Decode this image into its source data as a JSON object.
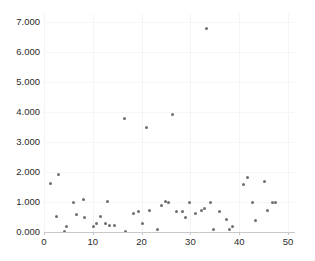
{
  "chart_data": {
    "type": "scatter",
    "title": "",
    "xlabel": "",
    "ylabel": "",
    "xlim": [
      0,
      51.5
    ],
    "ylim": [
      0,
      7000
    ],
    "xticks": [
      "0",
      "10",
      "20",
      "30",
      "40",
      "50"
    ],
    "xtick_values": [
      0,
      10,
      20,
      30,
      40,
      50
    ],
    "yticks": [
      "0.000",
      "1.000",
      "2.000",
      "3.000",
      "4.000",
      "5.000",
      "6.000",
      "7.000"
    ],
    "ytick_values": [
      0,
      1000,
      2000,
      3000,
      4000,
      5000,
      6000,
      7000
    ],
    "grid": true,
    "legend": null,
    "marker_color": "#6e6e6e",
    "axis_color": "#c9c9c9",
    "grid_color": "#f4f4f4",
    "background_color": "#ffffff",
    "series": [
      {
        "name": "series-1",
        "points": [
          [
            1.4,
            1633
          ],
          [
            2.9,
            1933
          ],
          [
            2.5,
            533
          ],
          [
            4.1,
            33
          ],
          [
            4.7,
            200
          ],
          [
            6.1,
            1000
          ],
          [
            6.6,
            567
          ],
          [
            8.0,
            1067
          ],
          [
            8.2,
            467
          ],
          [
            10.2,
            167
          ],
          [
            10.8,
            267
          ],
          [
            11.6,
            533
          ],
          [
            12.5,
            300
          ],
          [
            13.5,
            233
          ],
          [
            14.5,
            233
          ],
          [
            16.4,
            3767
          ],
          [
            16.8,
            33
          ],
          [
            18.3,
            633
          ],
          [
            19.3,
            700
          ],
          [
            20.1,
            267
          ],
          [
            21.1,
            3467
          ],
          [
            21.6,
            733
          ],
          [
            23.2,
            100
          ],
          [
            24.0,
            900
          ],
          [
            24.8,
            1033
          ],
          [
            26.4,
            3933
          ],
          [
            27.2,
            667
          ],
          [
            28.4,
            700
          ],
          [
            29.0,
            500
          ],
          [
            29.9,
            967
          ],
          [
            31.0,
            633
          ],
          [
            32.2,
            733
          ],
          [
            32.8,
            800
          ],
          [
            33.4,
            6767
          ],
          [
            34.8,
            100
          ],
          [
            36.0,
            700
          ],
          [
            37.3,
            433
          ],
          [
            38.1,
            100
          ],
          [
            38.7,
            200
          ],
          [
            40.8,
            1600
          ],
          [
            41.6,
            1833
          ],
          [
            42.7,
            967
          ],
          [
            43.4,
            400
          ],
          [
            45.2,
            1700
          ],
          [
            45.7,
            733
          ],
          [
            46.9,
            1000
          ],
          [
            47.5,
            967
          ],
          [
            25.6,
            1000
          ],
          [
            13.0,
            1033
          ],
          [
            34.2,
            967
          ]
        ]
      }
    ]
  },
  "axes": {
    "x_pixel_origin": 44,
    "x_pixel_per_unit": 4.88,
    "y_pixel_zero": 232,
    "y_pixel_per_unit": 0.03
  }
}
